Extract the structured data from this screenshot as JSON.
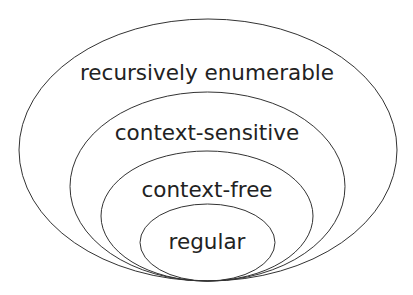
{
  "diagram": {
    "sets": [
      {
        "label": "recursively enumerable"
      },
      {
        "label": "context-sensitive"
      },
      {
        "label": "context-free"
      },
      {
        "label": "regular"
      }
    ]
  }
}
